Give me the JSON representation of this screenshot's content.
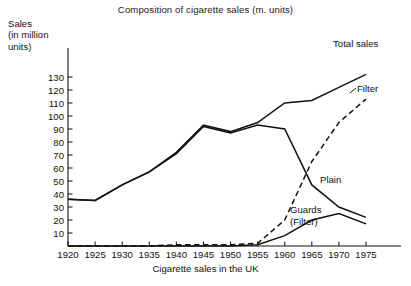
{
  "figure": {
    "title": "Composition of cigarette sales (m. units)",
    "x_axis_title": "Cigarette sales in the UK",
    "y_axis_title": "Sales\n(in million\nunits)",
    "cropped_top_text": "",
    "cropped_bottom_text": ""
  },
  "chart_data": {
    "type": "line",
    "title": "Composition of cigarette sales (m. units)",
    "xlabel": "Cigarette sales in the UK",
    "ylabel": "Sales (in million units)",
    "x": [
      1920,
      1925,
      1930,
      1935,
      1940,
      1945,
      1950,
      1955,
      1960,
      1965,
      1970,
      1975
    ],
    "xlim": [
      1920,
      1975
    ],
    "ylim": [
      0,
      135
    ],
    "xticks": [
      1920,
      1925,
      1930,
      1935,
      1940,
      1945,
      1950,
      1955,
      1960,
      1965,
      1970,
      1975
    ],
    "yticks": [
      10,
      20,
      30,
      40,
      50,
      60,
      70,
      80,
      90,
      100,
      110,
      120,
      130
    ],
    "grid": false,
    "legend": "inline-annotations",
    "series": [
      {
        "name": "Total sales",
        "style": "solid",
        "label_position": "top-right",
        "values": [
          36,
          35,
          47,
          57,
          72,
          93,
          88,
          95,
          110,
          112,
          122,
          132
        ]
      },
      {
        "name": "Plain",
        "style": "solid",
        "label_position": "middle-right",
        "values": [
          36,
          35,
          47,
          57,
          71,
          92,
          87,
          93,
          90,
          47,
          30,
          22
        ]
      },
      {
        "name": "Filter",
        "style": "dashed",
        "label_position": "upper-right",
        "values": [
          0,
          0,
          0,
          0,
          1,
          1,
          1,
          2,
          20,
          65,
          95,
          113
        ]
      },
      {
        "name": "Guards (Filter)",
        "style": "solid",
        "label_position": "lower-right",
        "values": [
          0,
          0,
          0,
          0,
          0,
          0,
          0,
          1,
          8,
          20,
          25,
          17
        ]
      }
    ]
  }
}
